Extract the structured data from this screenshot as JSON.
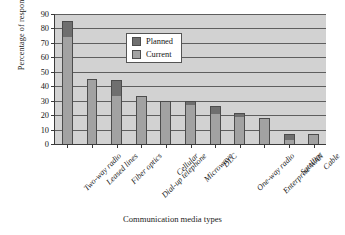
{
  "chart_data": {
    "type": "bar",
    "title": "",
    "xlabel": "Communication media types",
    "ylabel": "Percentage of respondents",
    "ylim": [
      0,
      90
    ],
    "yticks": [
      0,
      10,
      20,
      30,
      40,
      50,
      60,
      70,
      80,
      90
    ],
    "grid": true,
    "stacked": true,
    "legend_position": "top-left-inside",
    "categories": [
      "Two-way radio",
      "Leased lines",
      "Fiber optics",
      "Dial-up telephone",
      "Cellular",
      "Microwave",
      "DLC",
      "One-way radio",
      "Enterprise WAN",
      "Satellite",
      "Cable"
    ],
    "series": [
      {
        "name": "Current",
        "color": "#a2a2a2",
        "values": [
          74,
          45,
          33,
          33,
          30,
          27,
          21,
          19,
          18,
          3,
          7
        ]
      },
      {
        "name": "Planned",
        "color": "#6f6f6f",
        "values": [
          11,
          0,
          11,
          0,
          0,
          3,
          5,
          2.5,
          0,
          4,
          0
        ]
      }
    ],
    "totals": [
      85,
      45,
      44,
      33,
      30,
      30,
      26,
      21.5,
      18,
      7,
      7
    ]
  },
  "legend": {
    "items": [
      {
        "label": "Planned",
        "color": "#6f6f6f"
      },
      {
        "label": "Current",
        "color": "#a2a2a2"
      }
    ]
  },
  "colors": {
    "planned": "#6f6f6f",
    "current": "#a2a2a2",
    "plot_background": "#d2d2d2",
    "axis": "#3a3a3a",
    "page_background": "#ffffff"
  }
}
